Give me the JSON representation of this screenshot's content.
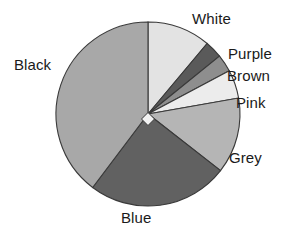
{
  "chart_data": {
    "type": "pie",
    "title": "",
    "subtitle": "",
    "xlabel": "",
    "ylabel": "",
    "legend_position": "none",
    "grid": false,
    "labels_position": "outside",
    "start_angle_deg": 0,
    "direction": "clockwise",
    "categories": [
      "White",
      "Purple",
      "Brown",
      "Pink",
      "Grey",
      "Blue",
      "Black"
    ],
    "values": [
      11.1,
      3.1,
      3.1,
      5.0,
      13.3,
      24.7,
      39.7
    ],
    "units": "percent",
    "slices": [
      {
        "label": "White",
        "value": 11.1,
        "start_deg": 0.0,
        "end_deg": 40.0,
        "color": "#e3e3e3"
      },
      {
        "label": "Purple",
        "value": 3.1,
        "start_deg": 40.0,
        "end_deg": 51.0,
        "color": "#5a5a5a"
      },
      {
        "label": "Brown",
        "value": 3.1,
        "start_deg": 51.0,
        "end_deg": 62.0,
        "color": "#8e8e8e"
      },
      {
        "label": "Pink",
        "value": 5.0,
        "start_deg": 62.0,
        "end_deg": 80.0,
        "color": "#ececec"
      },
      {
        "label": "Grey",
        "value": 13.3,
        "start_deg": 80.0,
        "end_deg": 128.0,
        "color": "#b5b5b5"
      },
      {
        "label": "Blue",
        "value": 24.7,
        "start_deg": 128.0,
        "end_deg": 217.0,
        "color": "#616161"
      },
      {
        "label": "Black",
        "value": 39.7,
        "start_deg": 217.0,
        "end_deg": 360.0,
        "color": "#a8a8a8"
      }
    ],
    "geometry": {
      "center_x": 148,
      "center_y": 114,
      "radius": 92,
      "center_marker": "white-diamond"
    },
    "colors": {
      "outline": "#3a3a3a",
      "background": "#ffffff",
      "text": "#1a1a1a"
    }
  },
  "labels": {
    "white": "White",
    "purple": "Purple",
    "brown": "Brown",
    "pink": "Pink",
    "grey": "Grey",
    "blue": "Blue",
    "black": "Black"
  }
}
